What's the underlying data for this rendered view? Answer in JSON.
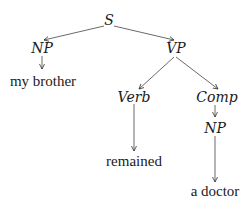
{
  "diagram": {
    "type": "syntax-tree",
    "nodes": {
      "s": {
        "label": "S",
        "x": 109,
        "y": 20
      },
      "np1": {
        "label": "NP",
        "x": 42,
        "y": 48
      },
      "np1_word": {
        "label": "my brother",
        "x": 43,
        "y": 81
      },
      "vp": {
        "label": "VP",
        "x": 176,
        "y": 48
      },
      "verb": {
        "label": "Verb",
        "x": 134,
        "y": 97
      },
      "verb_word": {
        "label": "remained",
        "x": 134,
        "y": 161
      },
      "comp": {
        "label": "Comp",
        "x": 217,
        "y": 97
      },
      "np2": {
        "label": "NP",
        "x": 215,
        "y": 128
      },
      "np2_word": {
        "label": "a doctor",
        "x": 215,
        "y": 191
      }
    },
    "edges": [
      {
        "from": "S",
        "to": "NP"
      },
      {
        "from": "S",
        "to": "VP"
      },
      {
        "from": "NP",
        "to": "my brother"
      },
      {
        "from": "VP",
        "to": "Verb"
      },
      {
        "from": "VP",
        "to": "Comp"
      },
      {
        "from": "Verb",
        "to": "remained"
      },
      {
        "from": "Comp",
        "to": "NP"
      },
      {
        "from": "NP",
        "to": "a doctor"
      }
    ],
    "colors": {
      "ink": "#1a1a1a",
      "background": "#ffffff"
    }
  }
}
